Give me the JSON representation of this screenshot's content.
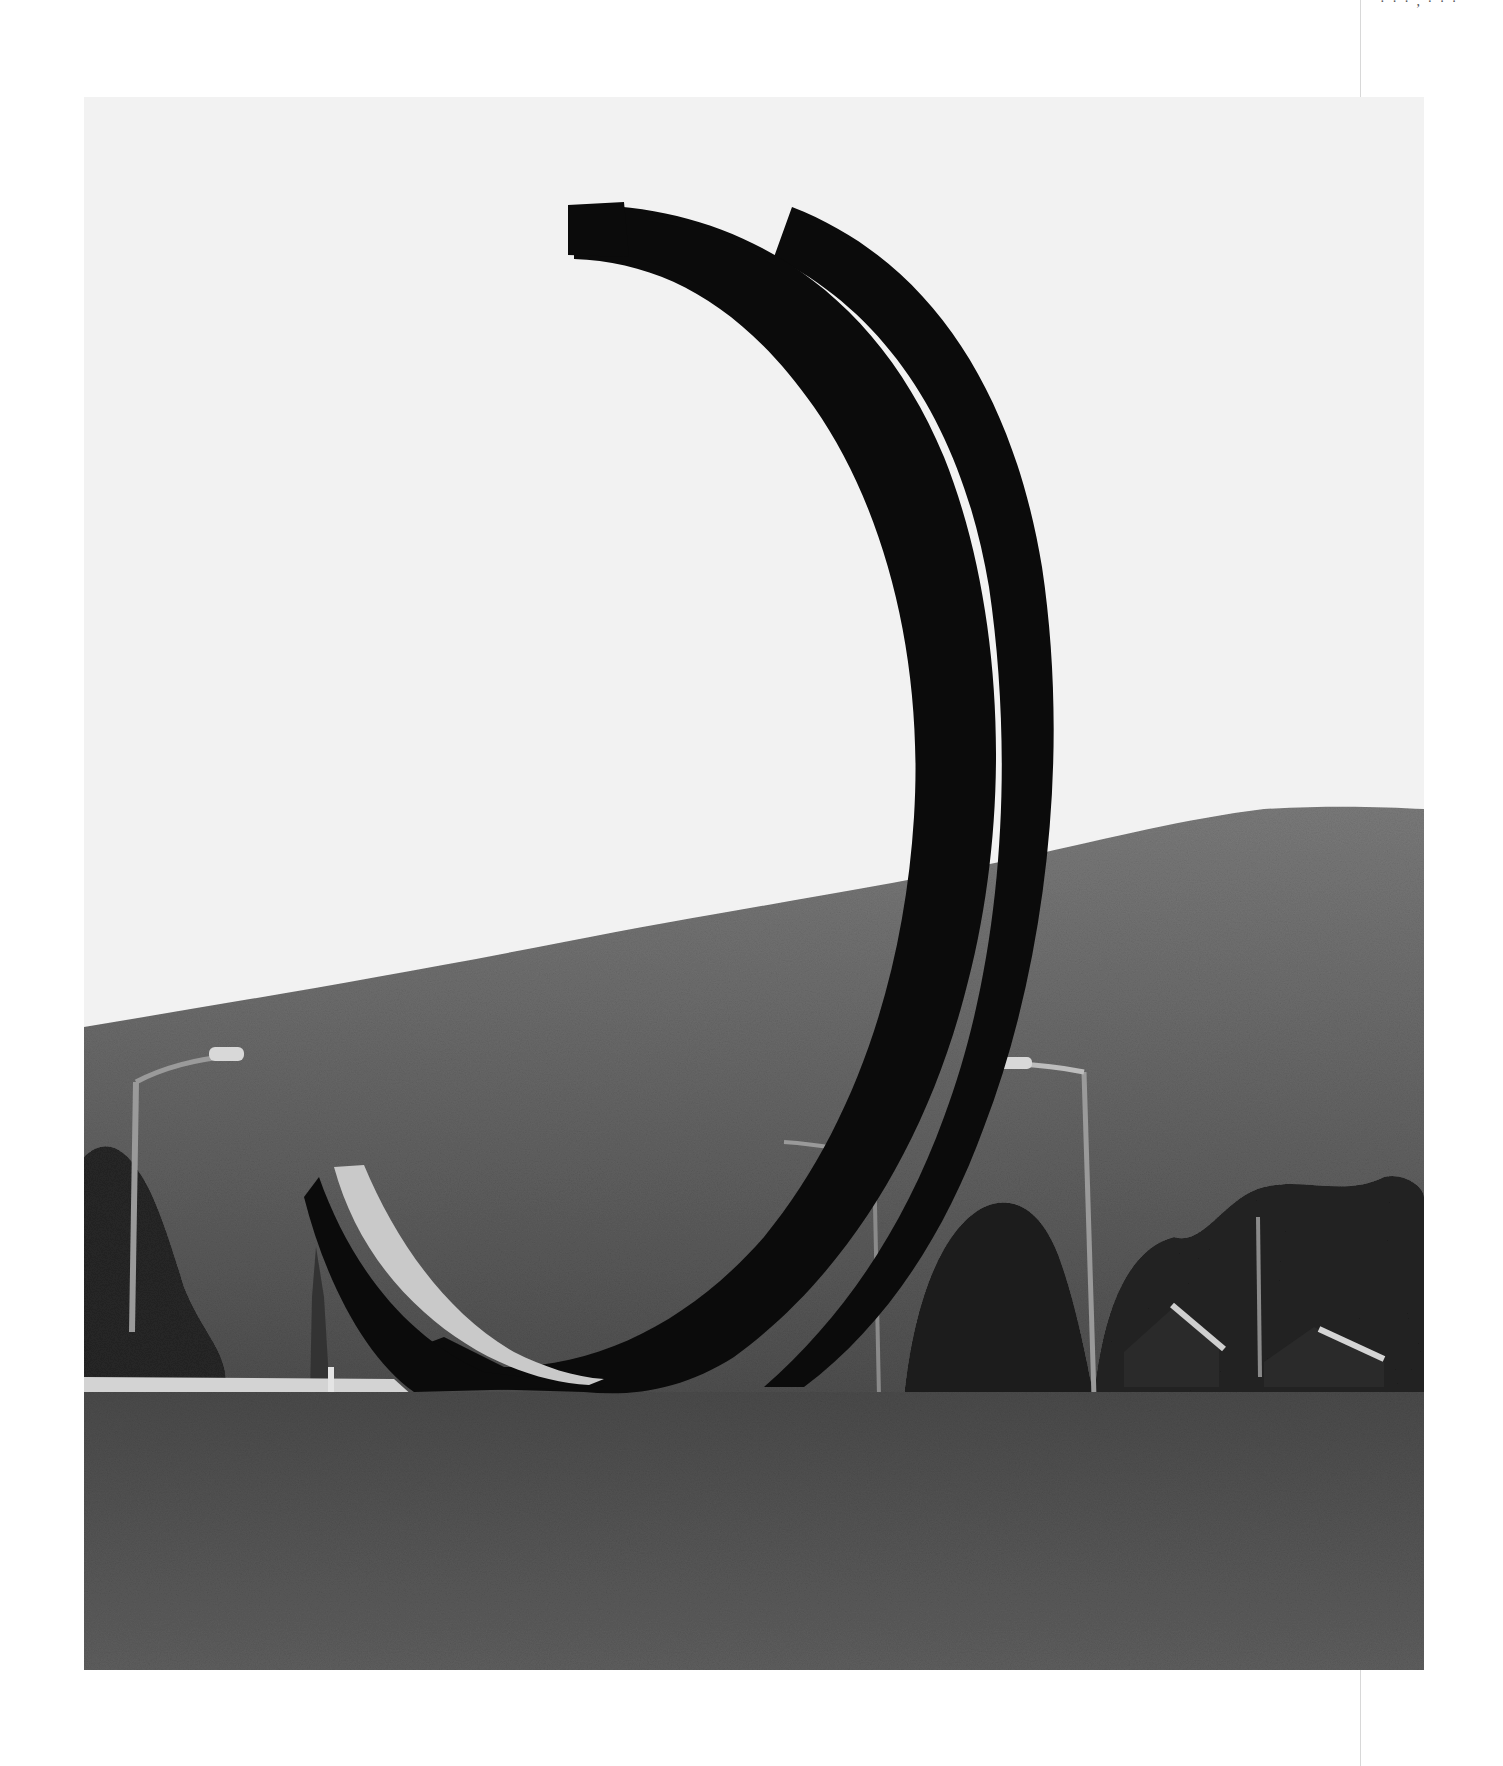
{
  "page": {
    "header_mark": "· · · , · · ·",
    "background_color": "#ffffff"
  },
  "photo": {
    "description": "Black and white photograph of a large steel sculpture of two intersecting arcs standing in a grass field in front of a wooded hill, with street lamps, trees and small houses in the background",
    "subject": "steel arc sculpture",
    "colors": {
      "sky": "#f2f2f2",
      "hill": "#6e6e6e",
      "hill_dark": "#4c4c4c",
      "grass": "#5a5a5a",
      "steel": "#0b0b0b",
      "steel_highlight": "#c9c9c9",
      "trees": "#222222",
      "road": "#d0d0d0"
    },
    "elements": {
      "arc_front": "front-arc",
      "arc_back": "rear-arc",
      "lamps": [
        "left-street-lamp",
        "right-street-lamp",
        "center-street-lamp"
      ],
      "houses": [
        "house-1",
        "house-2"
      ]
    }
  }
}
